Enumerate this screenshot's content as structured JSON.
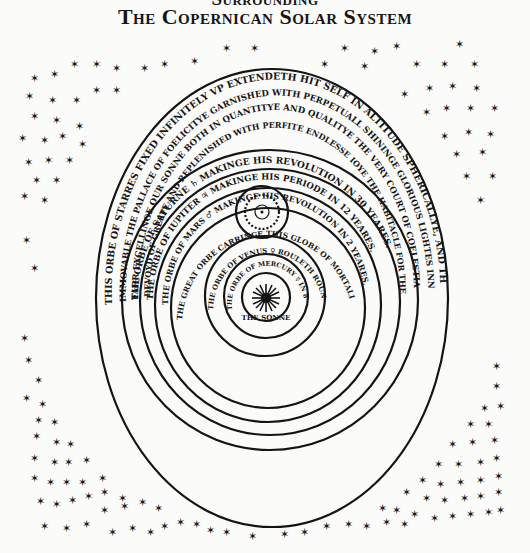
{
  "title": {
    "line1": "Surrounding",
    "line2": "The Copernican Solar System"
  },
  "diagram": {
    "fixed_stars": {
      "line1": "This orbe of starres fixed infinitely vp extendeth hit self in altitude sphericallye, and therfore",
      "line2": "immovable the pallace of foelicitye garnished with perpetuall shininge glorious lightes innvmerable,",
      "line3": "farr excellinge our sonne both in quantitye and qualitye the very court of coelestiall angelles",
      "line4": "devoyd of greefe and replenished with perfite endlesse ioye the habitacle for the elect."
    },
    "saturn": {
      "label": "The orbe of Saturne",
      "symbol": "♄",
      "text": "Makinge his revolution in 30 yeares."
    },
    "jupiter": {
      "label": "The orbe of Iupiter",
      "symbol": "♃",
      "text": "Makinge his periode in 12 yeares."
    },
    "mars": {
      "label": "The orbe of Mars",
      "symbol": "♂",
      "text": "Makinge his revolution in 2 yeares."
    },
    "great_orbe": {
      "label": "The great orbe carringe this globe of mortalitye",
      "text": "determineth our yeare",
      "sub": "his circular periode"
    },
    "venus": {
      "label": "The orbe of Venus",
      "symbol": "♀",
      "text": "Rouleth round in 9 months"
    },
    "mercury": {
      "label": "The orbe of Mercury",
      "symbol": "☿",
      "text": "in 80 dayes"
    },
    "sun": {
      "label": "The Sonne",
      "glyph": "☀"
    }
  },
  "colors": {
    "ink": "#141414",
    "paper": "#fbfbfa"
  }
}
